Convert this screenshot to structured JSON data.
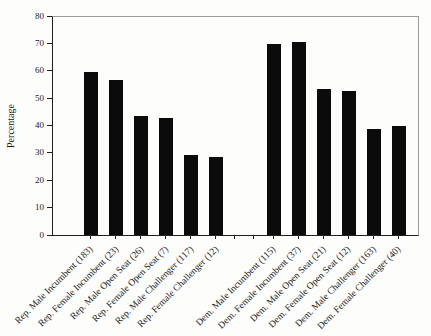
{
  "chart_data": {
    "type": "bar",
    "title": "",
    "xlabel": "",
    "ylabel": "Percentage",
    "ylim": [
      0,
      80
    ],
    "yticks": [
      0,
      10,
      20,
      30,
      40,
      50,
      60,
      70,
      80
    ],
    "grid": false,
    "legend": "none",
    "bar_color": "#0b0b0b",
    "axis_color": "#1f1f1f",
    "frame_color": "#9b9b9b",
    "categories": [
      "Rep. Male Incumbent (183)",
      "Rep. Female Incumbent (23)",
      "Rep. Male Open Seat (26)",
      "Rep. Female Open Seat (7)",
      "Rep. Male Challenger (117)",
      "Rep. Female Challenger (12)",
      "Dem. Male Incumbent (115)",
      "Dem. Female Incumbent (37)",
      "Dem. Male Open Seat (21)",
      "Dem. Female Open Seat (12)",
      "Dem. Male Challenger (163)",
      "Dem. Female Challenger (40)"
    ],
    "values": [
      60,
      57,
      43.5,
      43,
      29.5,
      28.5,
      70,
      71,
      53.5,
      53,
      39,
      40
    ],
    "gap_after_category_index": 5
  }
}
